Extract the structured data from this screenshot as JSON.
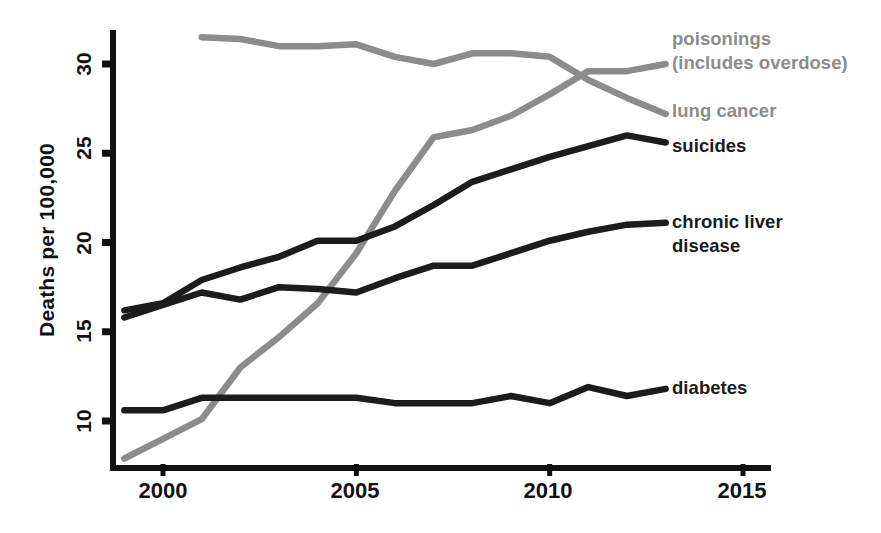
{
  "figure": {
    "cropped_top_text": "",
    "background_color": "#ffffff"
  },
  "axes": {
    "y_title": "Deaths per 100,000",
    "y_ticks": [
      "10",
      "15",
      "20",
      "25",
      "30"
    ],
    "x_ticks": [
      "2000",
      "2005",
      "2010",
      "2015"
    ],
    "axis_color": "#111111"
  },
  "labels": {
    "poisonings": "poisonings\n(includes overdose)",
    "lung_cancer": "lung cancer",
    "suicides": "suicides",
    "chronic_liver": "chronic liver\ndisease",
    "diabetes": "diabetes"
  },
  "chart_data": {
    "type": "line",
    "title": "",
    "xlabel": "",
    "ylabel": "Deaths per 100,000",
    "xlim": [
      1998.8,
      2015.5
    ],
    "ylim": [
      7.2,
      32.2
    ],
    "xticks": [
      2000,
      2005,
      2010,
      2015
    ],
    "yticks": [
      10,
      15,
      20,
      25,
      30
    ],
    "grid": false,
    "legend": "right-inline-labels",
    "series": [
      {
        "name": "poisonings (includes overdose)",
        "color": "#8c8c8c",
        "x": [
          1999,
          2000,
          2001,
          2002,
          2003,
          2004,
          2005,
          2006,
          2007,
          2008,
          2009,
          2010,
          2011,
          2012,
          2013
        ],
        "values": [
          7.9,
          9.0,
          10.1,
          13.0,
          14.7,
          16.6,
          19.4,
          22.9,
          25.9,
          26.3,
          27.1,
          28.3,
          29.6,
          29.6,
          30.0
        ]
      },
      {
        "name": "lung cancer",
        "color": "#8c8c8c",
        "x": [
          2001,
          2002,
          2003,
          2004,
          2005,
          2006,
          2007,
          2008,
          2009,
          2010,
          2011,
          2012,
          2013
        ],
        "values": [
          31.5,
          31.4,
          31.0,
          31.0,
          31.1,
          30.4,
          30.0,
          30.6,
          30.6,
          30.4,
          29.1,
          28.1,
          27.2
        ]
      },
      {
        "name": "suicides",
        "color": "#1c1c1c",
        "x": [
          1999,
          2000,
          2001,
          2002,
          2003,
          2004,
          2005,
          2006,
          2007,
          2008,
          2009,
          2010,
          2011,
          2012,
          2013
        ],
        "values": [
          16.2,
          16.6,
          17.9,
          18.6,
          19.2,
          20.1,
          20.1,
          20.9,
          22.1,
          23.4,
          24.1,
          24.8,
          25.4,
          26.0,
          25.6
        ]
      },
      {
        "name": "chronic liver disease",
        "color": "#1c1c1c",
        "x": [
          1999,
          2000,
          2001,
          2002,
          2003,
          2004,
          2005,
          2006,
          2007,
          2008,
          2009,
          2010,
          2011,
          2012,
          2013
        ],
        "values": [
          15.8,
          16.5,
          17.2,
          16.8,
          17.5,
          17.4,
          17.2,
          18.0,
          18.7,
          18.7,
          19.4,
          20.1,
          20.6,
          21.0,
          21.1
        ]
      },
      {
        "name": "diabetes",
        "color": "#1c1c1c",
        "x": [
          1999,
          2000,
          2001,
          2002,
          2003,
          2004,
          2005,
          2006,
          2007,
          2008,
          2009,
          2010,
          2011,
          2012,
          2013
        ],
        "values": [
          10.6,
          10.6,
          11.3,
          11.3,
          11.3,
          11.3,
          11.3,
          11.0,
          11.0,
          11.0,
          11.4,
          11.0,
          11.9,
          11.4,
          11.8
        ]
      }
    ]
  }
}
